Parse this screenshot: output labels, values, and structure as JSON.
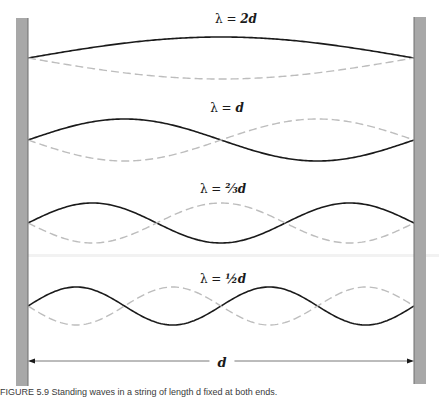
{
  "figure": {
    "labels": [
      {
        "lambda": "λ = ",
        "value": "2d",
        "y": 13
      },
      {
        "lambda": "λ = ",
        "value": "d",
        "y": 102
      },
      {
        "lambda": "λ = ",
        "value": "⅔d",
        "y": 183
      },
      {
        "lambda": "λ = ",
        "value": "½d",
        "y": 273
      }
    ],
    "dimension_label": "d",
    "caption": "FIGURE 5.9   Standing waves in a string of length d fixed at both ends.",
    "colors": {
      "wall": "#a8a8a8",
      "wall_edge": "#6e6e6e",
      "solid_wave": "#1a1a1a",
      "dashed_wave": "#bdbdbd",
      "dimension_line": "#555555"
    }
  },
  "diagram": {
    "walls": [
      {
        "name": "left-wall",
        "x": 16,
        "width": 12,
        "y_top": 18,
        "y_bottom": 386
      },
      {
        "name": "right-wall",
        "x": 414,
        "width": 12,
        "y_top": 17,
        "y_bottom": 384
      }
    ],
    "waves": [
      {
        "mode": "λ = 2d",
        "half_wavelengths": 1,
        "midline_y": 58,
        "amplitude": 21
      },
      {
        "mode": "λ = d",
        "half_wavelengths": 2,
        "midline_y": 140,
        "amplitude": 21
      },
      {
        "mode": "λ = ⅔d",
        "half_wavelengths": 3,
        "midline_y": 223,
        "amplitude": 20
      },
      {
        "mode": "λ = ½d",
        "half_wavelengths": 4,
        "midline_y": 306,
        "amplitude": 19
      }
    ],
    "dimension_arrow": {
      "x_start": 28,
      "x_end": 414,
      "y": 361,
      "label": "d"
    }
  }
}
